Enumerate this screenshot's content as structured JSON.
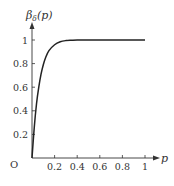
{
  "chart_data": {
    "type": "line",
    "title": "",
    "xlabel": "p",
    "ylabel": "β_δ(p)",
    "origin_label": "O",
    "xlim": [
      0,
      1
    ],
    "ylim": [
      0,
      1
    ],
    "x_ticks": [
      "0.2",
      "0.4",
      "0.6",
      "0.8",
      "1"
    ],
    "y_ticks": [
      "0.2",
      "0.4",
      "0.6",
      "0.8",
      "1"
    ],
    "grid": false,
    "legend": null,
    "series": [
      {
        "name": "β_δ(p)",
        "color": "#222222",
        "x": [
          0,
          0.02,
          0.04,
          0.06,
          0.08,
          0.1,
          0.12,
          0.15,
          0.2,
          0.25,
          0.3,
          0.35,
          0.4,
          0.5,
          0.6,
          0.7,
          0.8,
          0.9,
          1.0
        ],
        "y": [
          0,
          0.26,
          0.46,
          0.6,
          0.71,
          0.79,
          0.85,
          0.91,
          0.96,
          0.985,
          0.995,
          0.998,
          1.0,
          1.0,
          1.0,
          1.0,
          1.0,
          1.0,
          1.0
        ]
      }
    ]
  }
}
